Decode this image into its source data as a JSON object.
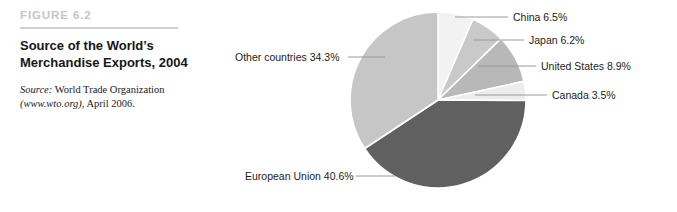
{
  "figure": {
    "number": "FIGURE 6.2",
    "title": "Source of the World’s Merchandise Exports, 2004",
    "source_label": "Source:",
    "source_org": " World Trade Organization",
    "source_url": "(www.wto.org)",
    "source_date": ", April 2006."
  },
  "chart_data": {
    "type": "pie",
    "title": "Source of the World’s Merchandise Exports, 2004",
    "subtitle": "",
    "xlabel": "",
    "ylabel": "",
    "units": "percent",
    "legend_position": "none",
    "labels_position": "outside-with-leader-lines",
    "categories": [
      "European Union",
      "Other countries",
      "China",
      "Japan",
      "United States",
      "Canada"
    ],
    "values": [
      40.6,
      34.3,
      6.5,
      6.2,
      8.9,
      3.5
    ],
    "slices": [
      {
        "name": "China",
        "value": 6.5,
        "label": "China 6.5%",
        "color": "#f2f2f2",
        "label_x": 288,
        "label_y": 11,
        "leader_from_x": 230,
        "leader_to_x": 283,
        "leader_y": 17
      },
      {
        "name": "Japan",
        "value": 6.2,
        "label": "Japan 6.2%",
        "color": "#c9c9c9",
        "label_x": 304,
        "label_y": 34,
        "leader_from_x": 248,
        "leader_to_x": 299,
        "leader_y": 40
      },
      {
        "name": "United States",
        "value": 8.9,
        "label": "United States 8.9%",
        "color": "#b8b8b8",
        "label_x": 316,
        "label_y": 60,
        "leader_from_x": 253,
        "leader_to_x": 311,
        "leader_y": 66
      },
      {
        "name": "Canada",
        "value": 3.5,
        "label": "Canada 3.5%",
        "color": "#ececec",
        "label_x": 327,
        "label_y": 89,
        "leader_from_x": 250,
        "leader_to_x": 322,
        "leader_y": 95
      },
      {
        "name": "European Union",
        "value": 40.6,
        "label": "European Union 40.6%",
        "color": "#606060",
        "label_x": 20,
        "label_y": 170,
        "leader_from_x": 131,
        "leader_to_x": 170,
        "leader_y": 176
      },
      {
        "name": "Other countries",
        "value": 34.3,
        "label": "Other countries 34.3%",
        "color": "#c6c6c6",
        "label_x": 10,
        "label_y": 51,
        "leader_from_x": 123,
        "leader_to_x": 160,
        "leader_y": 57
      }
    ],
    "geometry": {
      "center_x": 213,
      "center_y": 100,
      "radius": 88,
      "start_angle_deg": -90,
      "direction": "clockwise",
      "separator_color": "#ffffff",
      "separator_width": 1.6
    }
  }
}
